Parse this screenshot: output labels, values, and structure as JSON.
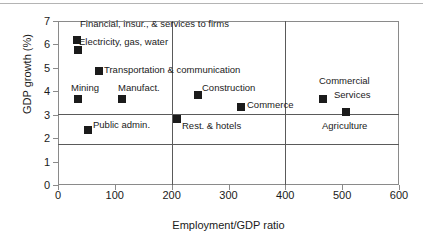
{
  "chart_data": {
    "type": "scatter",
    "title": "",
    "xlabel": "Employment/GDP ratio",
    "ylabel": "GDP growth (%)",
    "xlim": [
      0,
      600
    ],
    "ylim": [
      0,
      7
    ],
    "xticks": [
      0,
      100,
      200,
      300,
      400,
      500,
      600
    ],
    "yticks": [
      0,
      1,
      2,
      3,
      4,
      5,
      6,
      7
    ],
    "grid": false,
    "legend": "none",
    "reference_lines": {
      "horizontal": [
        3.9,
        1.75
      ],
      "vertical": [
        200,
        400
      ]
    },
    "points": [
      {
        "label": "Financial, insur., & services to firms",
        "x": 33,
        "y": 6.2,
        "label_pos": "right"
      },
      {
        "label": "Electricity, gas, water",
        "x": 35,
        "y": 5.75,
        "label_pos": "right"
      },
      {
        "label": "Transportation & communication",
        "x": 73,
        "y": 4.85,
        "label_pos": "right"
      },
      {
        "label": "Mining",
        "x": 35,
        "y": 3.65,
        "label_pos": "above"
      },
      {
        "label": "Manufact.",
        "x": 113,
        "y": 3.65,
        "label_pos": "above"
      },
      {
        "label": "Public admin.",
        "x": 53,
        "y": 2.35,
        "label_pos": "right"
      },
      {
        "label": "Rest. & hotels",
        "x": 210,
        "y": 2.8,
        "label_pos": "right"
      },
      {
        "label": "Construction",
        "x": 247,
        "y": 3.85,
        "label_pos": "right"
      },
      {
        "label": "Commerce",
        "x": 322,
        "y": 3.35,
        "label_pos": "right"
      },
      {
        "label": "Commercial Services",
        "x": 466,
        "y": 3.65,
        "label_pos": "right"
      },
      {
        "label": "Agriculture",
        "x": 507,
        "y": 3.1,
        "label_pos": "below"
      }
    ]
  },
  "axes": {
    "y_title": "GDP growth (%)",
    "x_title": "Employment/GDP ratio",
    "y_tick_labels": [
      "7",
      "6",
      "5",
      "4",
      "3",
      "2",
      "1",
      "0"
    ],
    "x_tick_labels": [
      "0",
      "100",
      "200",
      "300",
      "400",
      "500",
      "600"
    ]
  },
  "point_labels": {
    "financial": "Financial, insur., &  services to firms",
    "electricity": "Electricity, gas, water",
    "transportation": "Transportation & communication",
    "mining": "Mining",
    "manufact": "Manufact.",
    "public_admin": "Public admin.",
    "rest_hotels": "Rest. & hotels",
    "construction": "Construction",
    "commerce": "Commerce",
    "commercial": "Commercial",
    "services": "Services",
    "agriculture": "Agriculture"
  },
  "colors": {
    "marker": "#1b1b1b",
    "frame": "#8a8a8a",
    "reference_line": "#5a5a5a",
    "text": "#1a1a1a",
    "background": "#ffffff"
  }
}
